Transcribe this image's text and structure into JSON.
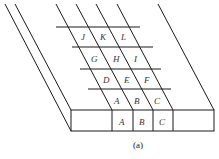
{
  "figure": {
    "caption": "(a)",
    "front_cells": [
      "A",
      "B",
      "C"
    ],
    "grid_rows": [
      [
        "J",
        "K",
        "L"
      ],
      [
        "G",
        "H",
        "I"
      ],
      [
        "D",
        "E",
        "F"
      ],
      [
        "A",
        "B",
        "C"
      ]
    ],
    "line_color": "#1a1a1a",
    "label_color": "#333333"
  }
}
